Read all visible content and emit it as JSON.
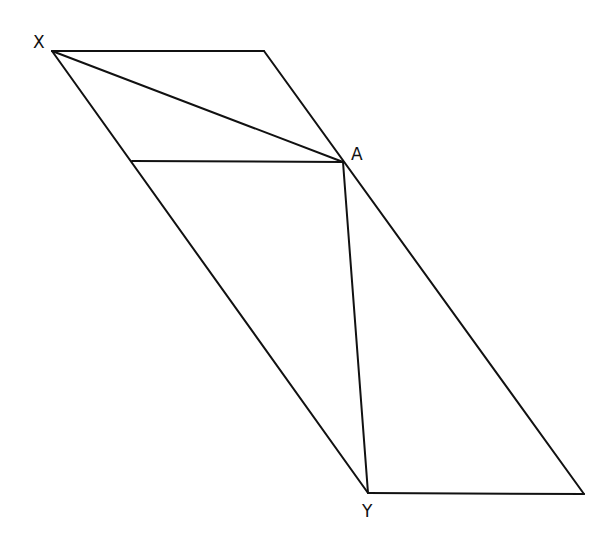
{
  "diagram": {
    "type": "geometry",
    "stroke_color": "#111111",
    "background": "#ffffff",
    "points": {
      "X": {
        "label": "X",
        "x": 52,
        "y": 51,
        "label_x": 33,
        "label_y": 48
      },
      "A": {
        "label": "A",
        "x": 343,
        "y": 162,
        "label_x": 351,
        "label_y": 160
      },
      "Y": {
        "label": "Y",
        "x": 368,
        "y": 493,
        "label_x": 362,
        "label_y": 517
      },
      "TR": {
        "x": 264,
        "y": 51
      },
      "BR": {
        "x": 584,
        "y": 494
      },
      "M": {
        "x": 132,
        "y": 161
      }
    },
    "segments": [
      {
        "from": "X",
        "to": "TR",
        "name": "top-edge"
      },
      {
        "from": "TR",
        "to": "BR",
        "name": "right-edge"
      },
      {
        "from": "Y",
        "to": "BR",
        "name": "bottom-edge"
      },
      {
        "from": "X",
        "to": "Y",
        "name": "left-edge"
      },
      {
        "from": "X",
        "to": "A",
        "name": "segment-xa"
      },
      {
        "from": "M",
        "to": "A",
        "name": "horizontal-segment"
      },
      {
        "from": "A",
        "to": "Y",
        "name": "segment-ay"
      }
    ],
    "labels": [
      "X",
      "A",
      "Y"
    ]
  }
}
